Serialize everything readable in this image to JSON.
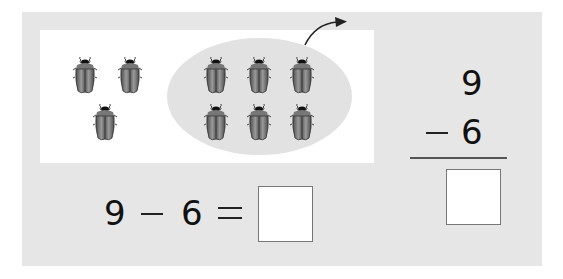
{
  "problem": {
    "minuend": "9",
    "subtrahend": "6",
    "operator": "−",
    "equals": "=",
    "answer": ""
  },
  "picture": {
    "total_bugs": 9,
    "remaining_bugs": 3,
    "leaving_bugs": 6,
    "icon": "beetle-icon",
    "arrow": "curved-arrow-right-icon"
  },
  "colors": {
    "panel": "#e6e6e6",
    "picture_bg": "#ffffff",
    "ellipse": "#e2e2e2",
    "text": "#111111",
    "box_border": "#777777"
  },
  "horizontal": {
    "a": "9",
    "op": "−",
    "b": "6",
    "eq": "="
  },
  "vertical": {
    "top": "9",
    "op": "−",
    "bottom": "6"
  }
}
